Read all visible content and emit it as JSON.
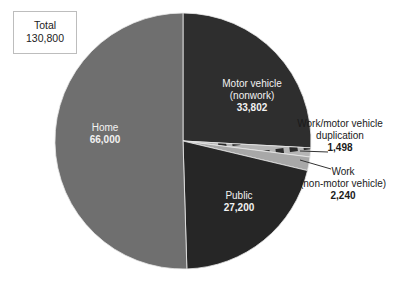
{
  "chart_data": {
    "type": "pie",
    "title": "",
    "total_label": "Total",
    "total_value": "130,800",
    "slices": [
      {
        "name": "Motor vehicle (nonwork)",
        "label_lines": [
          "Motor vehicle",
          "(nonwork)"
        ],
        "value": 33802,
        "value_label": "33,802",
        "color": "#2e2e2e",
        "pattern": "solid"
      },
      {
        "name": "Work/motor vehicle duplication",
        "label_lines": [
          "Work/motor vehicle",
          "duplication"
        ],
        "value": 1498,
        "value_label": "1,498",
        "color": "#b5b5b5",
        "pattern": "hatched"
      },
      {
        "name": "Work (non-motor vehicle)",
        "label_lines": [
          "Work",
          "(non-motor vehicle)"
        ],
        "value": 2240,
        "value_label": "2,240",
        "color": "#a8a8a8",
        "pattern": "solid"
      },
      {
        "name": "Public",
        "label_lines": [
          "Public"
        ],
        "value": 27200,
        "value_label": "27,200",
        "color": "#262626",
        "pattern": "solid"
      },
      {
        "name": "Home",
        "label_lines": [
          "Home"
        ],
        "value": 66000,
        "value_label": "66,000",
        "color": "#6f6f6f",
        "pattern": "solid"
      }
    ],
    "start_angle": "12 o'clock, clockwise",
    "legend": "none (direct labels)"
  },
  "labels": {
    "total_title": "Total",
    "total_value": "130,800",
    "motor_line1": "Motor vehicle",
    "motor_line2": "(nonwork)",
    "motor_value": "33,802",
    "dup_line1": "Work/motor vehicle",
    "dup_line2": "duplication",
    "dup_value": "1,498",
    "work_line1": "Work",
    "work_line2": "(non-motor vehicle)",
    "work_value": "2,240",
    "public_line1": "Public",
    "public_value": "27,200",
    "home_line1": "Home",
    "home_value": "66,000"
  }
}
